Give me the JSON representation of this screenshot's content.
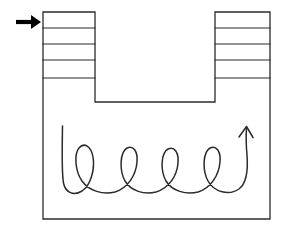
{
  "canvas": {
    "width": 281,
    "height": 238,
    "background_color": "#ffffff"
  },
  "diagram": {
    "title": "",
    "type": "line-drawing",
    "stroke_color": "#2b2b2b",
    "fill_color": "none",
    "line_width": 1.2
  },
  "vessel": {
    "name": "u-shaped-container",
    "outline_color": "#2b2b2b",
    "left_wall_x": 43,
    "right_wall_x": 270,
    "top_y": 12,
    "chamber_top_y": 102,
    "bottom_y": 219
  },
  "left_column": {
    "label": "",
    "x": 43,
    "width": 52,
    "top_y": 12,
    "bottom_y": 102,
    "segment_count": 6,
    "divider_ys": [
      28,
      44,
      60,
      78
    ]
  },
  "right_column": {
    "label": "",
    "x": 215,
    "width": 55,
    "top_y": 12,
    "bottom_y": 102,
    "segment_count": 6,
    "divider_ys": [
      28,
      44,
      60,
      78
    ]
  },
  "inlet_arrow": {
    "name": "inlet-arrow",
    "direction": "right",
    "style": "solid-filled",
    "color": "#000000",
    "tail_x": 16,
    "tip_x": 41,
    "y": 22
  },
  "coil": {
    "name": "coiled-path",
    "style": "hand-drawn",
    "loop_count": 4,
    "start_x": 62,
    "start_y": 126,
    "end_arrow_direction": "up",
    "end_x": 247,
    "end_y": 127,
    "stroke_color": "#2b2b2b"
  },
  "annotations": []
}
